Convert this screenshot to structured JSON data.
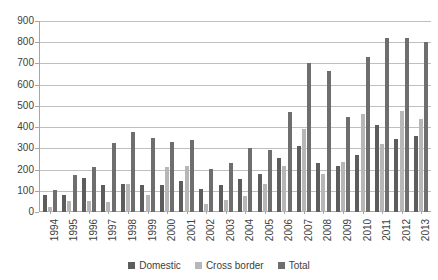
{
  "chart_data": {
    "type": "bar",
    "title": "",
    "subtitle": "",
    "xlabel": "",
    "ylabel": "",
    "ylim": [
      0,
      900
    ],
    "ytick_step": 100,
    "yticks": [
      900,
      800,
      700,
      600,
      500,
      400,
      300,
      200,
      100,
      0
    ],
    "grid": true,
    "legend_position": "bottom",
    "categories": [
      "1994",
      "1995",
      "1996",
      "1997",
      "1998",
      "1999",
      "2000",
      "2001",
      "2002",
      "2003",
      "2004",
      "2005",
      "2006",
      "2007",
      "2008",
      "2009",
      "2010",
      "2011",
      "2012",
      "2013"
    ],
    "series": [
      {
        "name": "Domestic",
        "color": "#5d5d5d",
        "values": [
          80,
          80,
          160,
          125,
          130,
          125,
          125,
          145,
          110,
          125,
          155,
          180,
          255,
          310,
          230,
          215,
          270,
          410,
          345,
          360
        ]
      },
      {
        "name": "Cross border",
        "color": "#b7b7b7",
        "values": [
          25,
          50,
          50,
          45,
          130,
          80,
          210,
          215,
          40,
          55,
          75,
          130,
          215,
          390,
          180,
          235,
          460,
          320,
          475,
          440
        ]
      },
      {
        "name": "Total",
        "color": "#6e6e6e",
        "values": [
          105,
          175,
          210,
          325,
          375,
          350,
          330,
          340,
          205,
          230,
          300,
          290,
          470,
          700,
          665,
          450,
          730,
          820,
          820,
          800
        ]
      }
    ]
  },
  "legend": {
    "items": [
      {
        "label": "Domestic",
        "color": "#5d5d5d"
      },
      {
        "label": "Cross border",
        "color": "#b7b7b7"
      },
      {
        "label": "Total",
        "color": "#6e6e6e"
      }
    ]
  },
  "axes": {
    "y_max": 900,
    "y_min": 0
  }
}
